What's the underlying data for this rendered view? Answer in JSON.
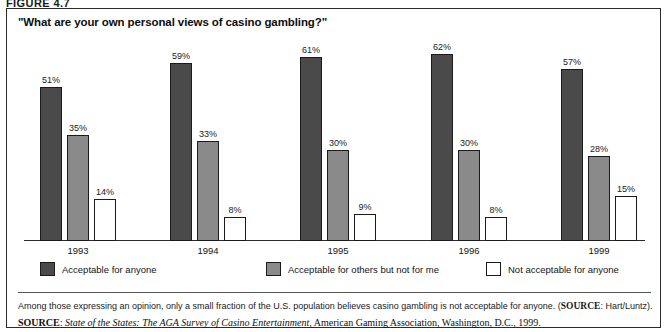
{
  "figure": {
    "label": "FIGURE 4.7"
  },
  "chart_title": "\"What are your own personal views of casino gambling?\"",
  "chart_data": {
    "type": "bar",
    "title": "\"What are your own personal views of casino gambling?\"",
    "xlabel": "",
    "ylabel": "",
    "ylim": [
      0,
      65
    ],
    "grid": false,
    "legend_position": "bottom",
    "categories": [
      "1993",
      "1994",
      "1995",
      "1996",
      "1999"
    ],
    "series": [
      {
        "name": "Acceptable for anyone",
        "color": "#4a4a4a",
        "values": [
          51,
          59,
          61,
          62,
          57
        ],
        "labels": [
          "51%",
          "59%",
          "61%",
          "62%",
          "57%"
        ]
      },
      {
        "name": "Acceptable for others but not for me",
        "color": "#8a8a8a",
        "values": [
          35,
          33,
          30,
          30,
          28
        ],
        "labels": [
          "35%",
          "33%",
          "30%",
          "30%",
          "28%"
        ]
      },
      {
        "name": "Not acceptable for anyone",
        "color": "#ffffff",
        "values": [
          14,
          8,
          9,
          8,
          15
        ],
        "labels": [
          "14%",
          "8%",
          "9%",
          "8%",
          "15%"
        ]
      }
    ]
  },
  "legend": {
    "items": [
      {
        "label": "Acceptable for anyone",
        "color": "#4a4a4a"
      },
      {
        "label": "Acceptable for others but not for me",
        "color": "#8a8a8a"
      },
      {
        "label": "Not acceptable for anyone",
        "color": "#ffffff"
      }
    ]
  },
  "footnote": {
    "text": "Among those expressing an opinion, only a small fraction of the U.S. population believes casino gambling is not acceptable for anyone. (",
    "source_caps": "SOURCE",
    "source_rest": ": Hart/Luntz)."
  },
  "source": {
    "caps": "SOURCE",
    "colon": ": ",
    "italic_title": "State of the States: The AGA Survey of Casino Entertainment",
    "rest": ", American Gaming Association, Washington, D.C., 1999."
  }
}
